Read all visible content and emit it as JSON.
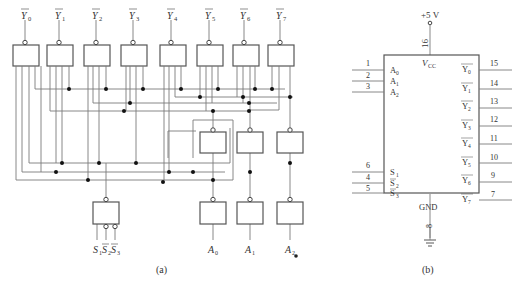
{
  "figure_a": {
    "caption": "(a)",
    "outputs": [
      {
        "name": "Y",
        "sub": "0"
      },
      {
        "name": "Y",
        "sub": "1"
      },
      {
        "name": "Y",
        "sub": "2"
      },
      {
        "name": "Y",
        "sub": "3"
      },
      {
        "name": "Y",
        "sub": "4"
      },
      {
        "name": "Y",
        "sub": "5"
      },
      {
        "name": "Y",
        "sub": "6"
      },
      {
        "name": "Y",
        "sub": "7"
      }
    ],
    "address_inputs": [
      {
        "name": "A",
        "sub": "0"
      },
      {
        "name": "A",
        "sub": "1"
      },
      {
        "name": "A",
        "sub": "2"
      }
    ],
    "enable_inputs": [
      {
        "name": "S",
        "sub": "1",
        "inverted": false
      },
      {
        "name": "S",
        "sub": "2",
        "inverted": true
      },
      {
        "name": "S",
        "sub": "3",
        "inverted": true
      }
    ]
  },
  "figure_b": {
    "caption": "(b)",
    "supply": "+5 V",
    "vcc_pin": "16",
    "vcc_label": "V",
    "vcc_sub": "CC",
    "gnd_label": "GND",
    "gnd_pin": "8",
    "left_pins": [
      {
        "pin": "1",
        "name": "A",
        "sub": "0"
      },
      {
        "pin": "2",
        "name": "A",
        "sub": "1"
      },
      {
        "pin": "3",
        "name": "A",
        "sub": "2"
      },
      {
        "pin": "6",
        "name": "S",
        "sub": "1"
      },
      {
        "pin": "4",
        "name": "S",
        "sub": "2"
      },
      {
        "pin": "5",
        "name": "S",
        "sub": "3"
      }
    ],
    "right_pins": [
      {
        "pin": "15",
        "name": "Y",
        "sub": "0"
      },
      {
        "pin": "14",
        "name": "Y",
        "sub": "1"
      },
      {
        "pin": "13",
        "name": "Y",
        "sub": "2"
      },
      {
        "pin": "12",
        "name": "Y",
        "sub": "3"
      },
      {
        "pin": "11",
        "name": "Y",
        "sub": "4"
      },
      {
        "pin": "10",
        "name": "Y",
        "sub": "5"
      },
      {
        "pin": "9",
        "name": "Y",
        "sub": "6"
      },
      {
        "pin": "7",
        "name": "Y",
        "sub": "7"
      }
    ]
  }
}
